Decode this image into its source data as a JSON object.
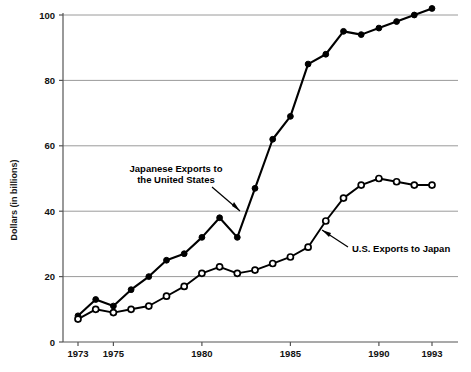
{
  "chart_data": {
    "type": "line",
    "title": "",
    "subtitle": "",
    "xlabel": "",
    "ylabel": "Dollars (in billions)",
    "xlim": [
      1972.5,
      1993.6
    ],
    "ylim": [
      0,
      104
    ],
    "yticks": [
      0,
      20,
      40,
      60,
      80,
      100
    ],
    "ytick_labels": [
      "0",
      "20",
      "40",
      "60",
      "80",
      "100"
    ],
    "xticks": [
      1973,
      1975,
      1980,
      1985,
      1990,
      1993
    ],
    "xtick_labels": [
      "1973",
      "1975",
      "1980",
      "1985",
      "1990",
      "1993"
    ],
    "grid": "horizontal",
    "legend_position": "inline-annotations",
    "x": [
      1973,
      1974,
      1975,
      1976,
      1977,
      1978,
      1979,
      1980,
      1981,
      1982,
      1983,
      1984,
      1985,
      1986,
      1987,
      1988,
      1989,
      1990,
      1991,
      1992,
      1993
    ],
    "series": [
      {
        "name": "Japanese Exports to the United States",
        "marker": "filled-circle",
        "values": [
          8,
          13,
          11,
          16,
          20,
          25,
          27,
          32,
          38,
          32,
          47,
          62,
          69,
          85,
          88,
          95,
          94,
          96,
          98,
          100,
          102
        ]
      },
      {
        "name": "U.S. Exports to Japan",
        "marker": "open-circle",
        "values": [
          7,
          10,
          9,
          10,
          11,
          14,
          17,
          21,
          23,
          21,
          22,
          24,
          26,
          29,
          37,
          44,
          48,
          50,
          49,
          48,
          48
        ]
      }
    ],
    "annotations": [
      {
        "name": "japan-exports-label",
        "text_line1": "Japanese Exports to",
        "text_line2": "the United States",
        "target_series": "Japanese Exports to the United States"
      },
      {
        "name": "us-exports-label",
        "text_line1": "U.S. Exports to Japan",
        "text_line2": "",
        "target_series": "U.S. Exports to Japan"
      }
    ],
    "colors": {
      "line": "#000000",
      "grid": "#9a9a9a",
      "axis": "#555555",
      "background": "#ffffff",
      "marker_fill_open": "#ffffff"
    }
  }
}
